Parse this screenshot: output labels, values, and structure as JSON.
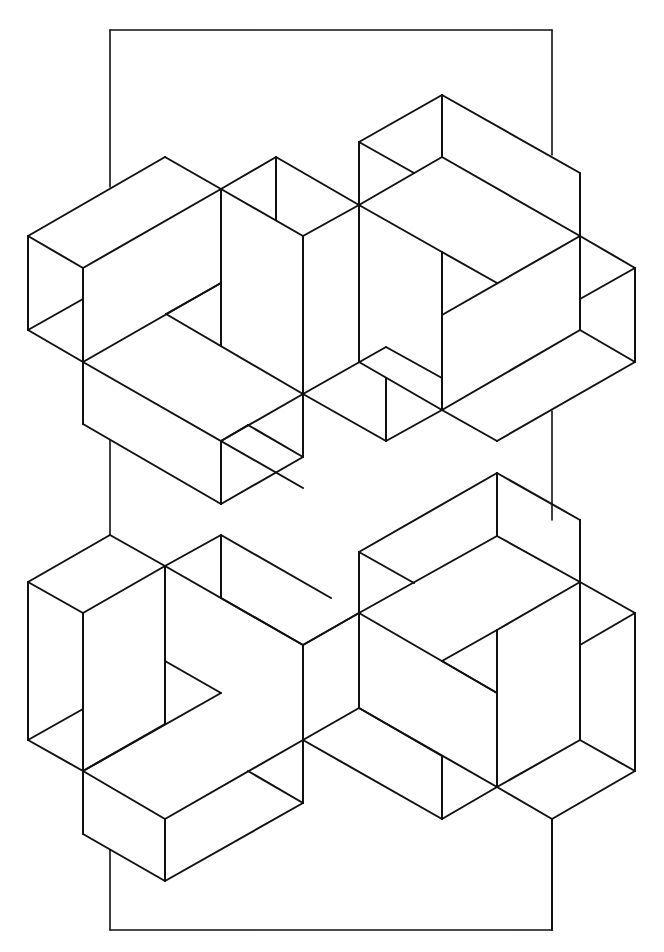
{
  "artwork": {
    "title": "Isometric line drawing of interlocking open boxes within a rectangular frame",
    "style": "black line art on white background",
    "stroke_color": "#111111",
    "background_color": "#ffffff",
    "figures": [
      {
        "name": "top-left-figure",
        "description": "interlocking open box forms (upper left)"
      },
      {
        "name": "top-right-figure",
        "description": "interlocking open box forms (upper right)"
      },
      {
        "name": "bottom-left-figure",
        "description": "interlocking open box forms (lower left)"
      },
      {
        "name": "bottom-right-figure",
        "description": "interlocking open box forms (lower right)"
      }
    ],
    "frame": {
      "name": "background-rectangle",
      "description": "tall rectangle partially hidden behind the figures"
    }
  }
}
